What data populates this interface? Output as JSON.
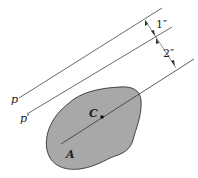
{
  "diagram": {
    "labels": {
      "p": "p",
      "p_prime": "p′",
      "centroid": "C",
      "area": "A"
    },
    "dimensions": {
      "d1": "1″",
      "d2": "2″"
    },
    "colors": {
      "area_fill": "#a8a8a8",
      "line": "#333333"
    }
  }
}
